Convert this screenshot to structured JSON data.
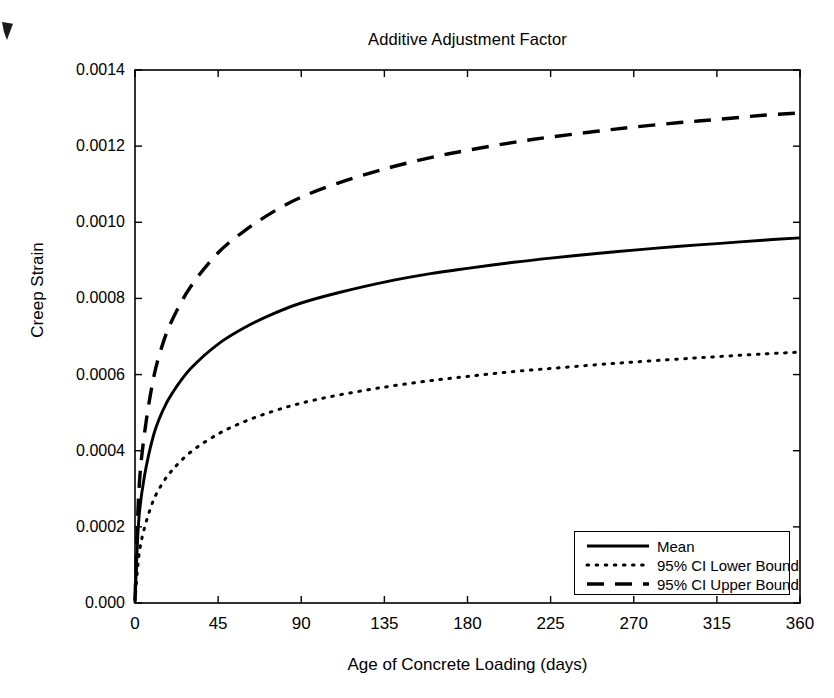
{
  "chart_data": {
    "type": "line",
    "title": "Additive Adjustment Factor",
    "xlabel": "Age of Concrete Loading (days)",
    "ylabel": "Creep Strain",
    "xlim": [
      0,
      360
    ],
    "ylim": [
      0.0,
      0.0014
    ],
    "grid": false,
    "legend_position": "lower right",
    "xticks": [
      0,
      45,
      90,
      135,
      180,
      225,
      270,
      315,
      360
    ],
    "xtick_labels": [
      "0",
      "45",
      "90",
      "135",
      "180",
      "225",
      "270",
      "315",
      "360"
    ],
    "yticks": [
      0.0,
      0.0002,
      0.0004,
      0.0006,
      0.0008,
      0.001,
      0.0012,
      0.0014
    ],
    "ytick_labels": [
      "0.000",
      "0.0002",
      "0.0004",
      "0.0006",
      "0.0008",
      "0.0010",
      "0.0012",
      "0.0014"
    ],
    "x": [
      0,
      2,
      5,
      10,
      15,
      20,
      30,
      45,
      60,
      75,
      90,
      110,
      135,
      160,
      180,
      205,
      225,
      250,
      270,
      295,
      315,
      340,
      360
    ],
    "series": [
      {
        "name": "Mean",
        "style": "solid",
        "color": "#000000",
        "values": [
          5e-06,
          0.000215,
          0.00033,
          0.00044,
          0.000505,
          0.00055,
          0.000615,
          0.00068,
          0.000725,
          0.00076,
          0.000788,
          0.000815,
          0.000843,
          0.000865,
          0.000879,
          0.000895,
          0.000906,
          0.000918,
          0.000927,
          0.000937,
          0.000944,
          0.000953,
          0.000959
        ]
      },
      {
        "name": "95% CI Lower Bound",
        "style": "dotted",
        "color": "#000000",
        "values": [
          3e-06,
          0.00012,
          0.000195,
          0.00027,
          0.000315,
          0.000348,
          0.000396,
          0.000444,
          0.000478,
          0.000504,
          0.000525,
          0.000546,
          0.000567,
          0.000584,
          0.000595,
          0.000608,
          0.000616,
          0.000626,
          0.000633,
          0.000641,
          0.000647,
          0.000654,
          0.000659
        ]
      },
      {
        "name": "95% CI Upper Bound",
        "style": "dashed",
        "color": "#000000",
        "values": [
          8e-06,
          0.000285,
          0.00044,
          0.00059,
          0.00068,
          0.000742,
          0.00083,
          0.00092,
          0.00098,
          0.001028,
          0.001066,
          0.001103,
          0.00114,
          0.00117,
          0.001189,
          0.00121,
          0.001224,
          0.001239,
          0.00125,
          0.001262,
          0.00127,
          0.001281,
          0.001287
        ]
      }
    ]
  },
  "axes": {
    "plot_left": 135,
    "plot_right": 800,
    "plot_top": 70,
    "plot_bottom": 603
  },
  "legend": {
    "items": [
      {
        "label": "Mean",
        "style": "solid"
      },
      {
        "label": "95% CI Lower Bound",
        "style": "dotted"
      },
      {
        "label": "95% CI Upper Bound",
        "style": "dashed"
      }
    ]
  }
}
